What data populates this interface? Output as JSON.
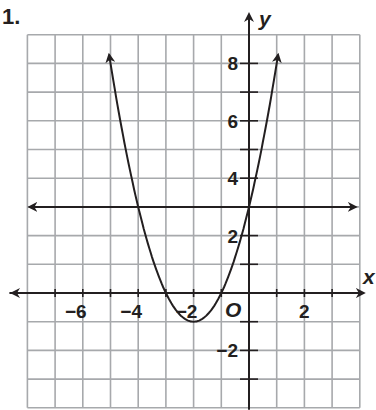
{
  "problem_number": "1.",
  "colors": {
    "grid": "#a7a9ac",
    "axis": "#231f20",
    "curve": "#231f20",
    "background": "#ffffff"
  },
  "chart_data": {
    "type": "line",
    "title": "",
    "xlabel": "x",
    "ylabel": "y",
    "origin_label": "O",
    "xlim": [
      -8,
      4
    ],
    "ylim": [
      -4,
      9
    ],
    "grid": true,
    "grid_step": 1,
    "x_tick_labels": [
      {
        "value": -6,
        "label": "−6"
      },
      {
        "value": -4,
        "label": "−4"
      },
      {
        "value": -2,
        "label": "−2"
      },
      {
        "value": 2,
        "label": "2"
      }
    ],
    "y_tick_labels": [
      {
        "value": 8,
        "label": "8"
      },
      {
        "value": 6,
        "label": "6"
      },
      {
        "value": 4,
        "label": "4"
      },
      {
        "value": 2,
        "label": "2"
      },
      {
        "value": -2,
        "label": "−2"
      }
    ],
    "series": [
      {
        "name": "parabola",
        "equation": "y = x^2 + 4x + 3",
        "vertex": [
          -2,
          -1
        ],
        "x_intercepts": [
          -3,
          -1
        ],
        "y_intercept": 3,
        "x": [
          -5,
          -4.5,
          -4,
          -3.5,
          -3,
          -2.5,
          -2,
          -1.5,
          -1,
          -0.5,
          0,
          0.5,
          1
        ],
        "values": [
          8,
          5.25,
          3,
          1.25,
          0,
          -0.75,
          -1,
          -0.75,
          0,
          1.25,
          3,
          5.25,
          8
        ],
        "arrows": "both ends"
      },
      {
        "name": "horizontal line",
        "equation": "y = 3",
        "x": [
          -8,
          4
        ],
        "values": [
          3,
          3
        ],
        "arrows": "both ends"
      }
    ]
  }
}
